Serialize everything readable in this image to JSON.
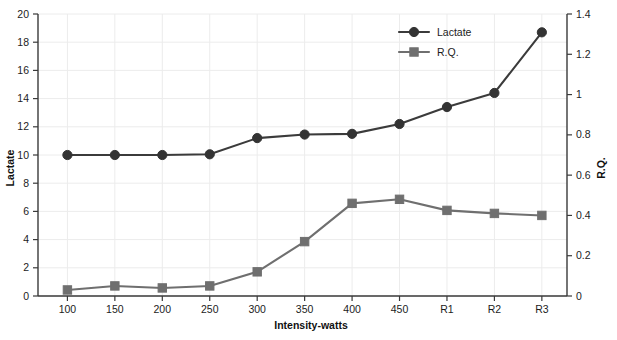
{
  "chart_data": {
    "type": "line",
    "title": "",
    "xlabel": "Intensity-watts",
    "ylabel": "Lactate",
    "y2label": "R.Q.",
    "categories": [
      "100",
      "150",
      "200",
      "250",
      "300",
      "350",
      "400",
      "450",
      "R1",
      "R2",
      "R3"
    ],
    "ylim": [
      0,
      20
    ],
    "yticks": [
      "0",
      "2",
      "4",
      "6",
      "8",
      "10",
      "12",
      "14",
      "16",
      "18",
      "20"
    ],
    "y2lim": [
      0,
      1.4
    ],
    "y2ticks": [
      "0",
      "0.2",
      "0.4",
      "0.6",
      "0.8",
      "1",
      "1.2",
      "1.4"
    ],
    "grid": true,
    "legend_position": "top-right",
    "series": [
      {
        "name": "Lactate",
        "axis": "left",
        "marker": "circle",
        "color": "#333333",
        "values": [
          10.0,
          10.0,
          10.0,
          10.05,
          11.2,
          11.45,
          11.5,
          12.2,
          13.4,
          14.4,
          18.7
        ]
      },
      {
        "name": "R.Q.",
        "axis": "right",
        "marker": "square",
        "color": "#6f6f6f",
        "values": [
          0.03,
          0.05,
          0.04,
          0.05,
          0.12,
          0.27,
          0.46,
          0.48,
          0.425,
          0.41,
          0.4
        ]
      }
    ]
  },
  "legend": {
    "entries": [
      {
        "label": "Lactate",
        "marker": "circle-marker",
        "color": "#333333"
      },
      {
        "label": "R.Q.",
        "marker": "square-marker",
        "color": "#6f6f6f"
      }
    ]
  },
  "axes": {
    "left_title": "Lactate",
    "right_title": "R.Q.",
    "bottom_title": "Intensity-watts"
  }
}
